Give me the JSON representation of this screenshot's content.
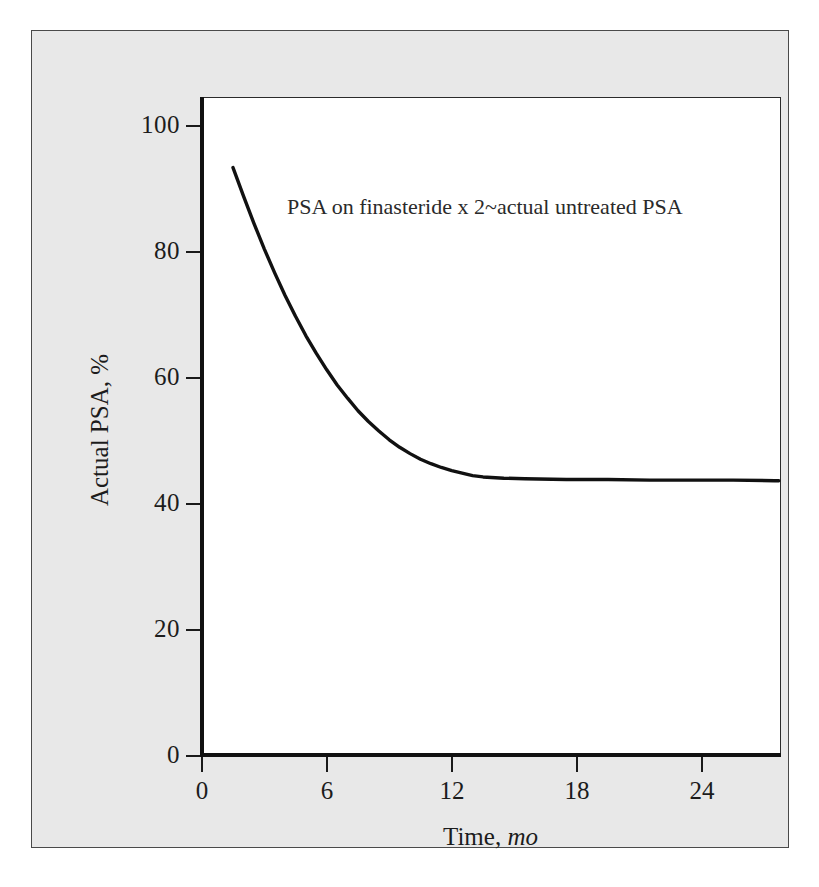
{
  "figure": {
    "background_color": "#ffffff",
    "panel_color": "#e8e8e8",
    "plot_background": "#ffffff",
    "line_color": "#111111",
    "text_color": "#1c1c1c"
  },
  "annotation": {
    "text": "PSA on finasteride x 2~actual untreated PSA"
  },
  "axes": {
    "y_title": "Actual PSA, %",
    "x_title_main": "Time, ",
    "x_title_unit": "mo"
  },
  "chart_data": {
    "type": "line",
    "title": "",
    "subtitle": "",
    "xlabel": "Time, mo",
    "ylabel": "Actual PSA, %",
    "xlim": [
      0,
      27.8
    ],
    "ylim": [
      0,
      104
    ],
    "xticks": [
      0,
      6,
      12,
      18,
      24
    ],
    "xtick_labels": [
      "0",
      "6",
      "12",
      "18",
      "24"
    ],
    "yticks": [
      0,
      20,
      40,
      60,
      80,
      100
    ],
    "ytick_labels": [
      "0",
      "20",
      "40",
      "60",
      "80",
      "100"
    ],
    "grid": false,
    "legend": null,
    "annotations": [
      {
        "text": "PSA on finasteride x 2~actual untreated PSA",
        "x": 7.0,
        "y": 86
      }
    ],
    "series": [
      {
        "name": "Actual PSA",
        "x": [
          0,
          0.5,
          1,
          1.5,
          2,
          2.5,
          3,
          3.5,
          4,
          4.5,
          5,
          5.5,
          6,
          6.5,
          7,
          7.5,
          8,
          8.5,
          9,
          9.5,
          10,
          10.5,
          11,
          11.5,
          12,
          13,
          14,
          16,
          18,
          20,
          22,
          24,
          26,
          26.2
        ],
        "y": [
          98.0,
          93.5,
          89.2,
          85.1,
          81.3,
          77.7,
          74.4,
          71.3,
          68.5,
          65.9,
          63.5,
          61.4,
          59.4,
          57.7,
          56.2,
          54.8,
          53.6,
          52.6,
          51.7,
          51.0,
          50.4,
          49.9,
          49.5,
          49.1,
          48.9,
          48.7,
          48.6,
          48.5,
          48.5,
          48.4,
          48.4,
          48.4,
          48.3,
          48.3
        ]
      }
    ]
  }
}
